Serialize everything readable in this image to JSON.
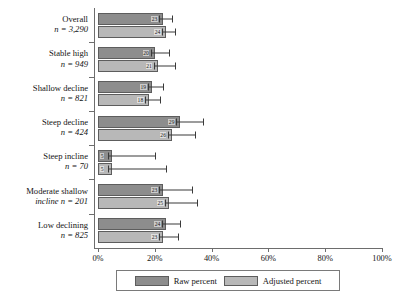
{
  "chart_data": {
    "type": "bar",
    "orientation": "horizontal",
    "title": "",
    "xlabel": "",
    "ylabel": "",
    "xlim": [
      0,
      100
    ],
    "xticks": [
      0,
      20,
      40,
      60,
      80,
      100
    ],
    "xtick_labels": [
      "0%",
      "20%",
      "40%",
      "60%",
      "80%",
      "100%"
    ],
    "grid": false,
    "legend_position": "bottom",
    "categories": [
      "Overall",
      "Stable high",
      "Shallow decline",
      "Steep decline",
      "Steep incline",
      "Moderate shallow incline",
      "Low declining"
    ],
    "category_counts": [
      "n = 3,290",
      "n = 949",
      "n = 821",
      "n = 424",
      "n = 70",
      "n = 201",
      "n = 825"
    ],
    "series": [
      {
        "name": "Raw percent",
        "color": "#8d8d8d",
        "values": [
          23,
          20,
          19,
          29,
          5,
          23,
          24
        ],
        "error_high": [
          26,
          25,
          23,
          37,
          20,
          33,
          29
        ]
      },
      {
        "name": "Adjusted percent",
        "color": "#b8b8b8",
        "values": [
          24,
          21,
          18,
          26,
          5,
          25,
          23
        ],
        "error_high": [
          27,
          27,
          22,
          34,
          24,
          35,
          28
        ]
      }
    ]
  },
  "legend": {
    "items": [
      {
        "label": "Raw percent",
        "swatch": "raw"
      },
      {
        "label": "Adjusted percent",
        "swatch": "adj"
      }
    ]
  }
}
